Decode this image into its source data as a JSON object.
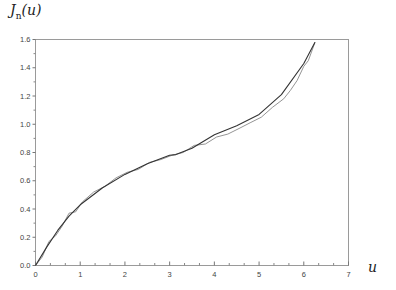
{
  "chart_data": {
    "type": "line",
    "title": "",
    "ylabel": "J_n(u)",
    "xlabel": "u",
    "xlim": [
      0,
      7
    ],
    "ylim": [
      0,
      1.6
    ],
    "xticks": [
      0,
      1,
      2,
      3,
      4,
      5,
      6,
      7
    ],
    "yticks": [
      0.0,
      0.2,
      0.4,
      0.6,
      0.8,
      1.0,
      1.2,
      1.4,
      1.6
    ],
    "xtick_labels": [
      "0",
      "1",
      "2",
      "3",
      "4",
      "5",
      "6",
      "7"
    ],
    "ytick_labels": [
      "0.0",
      "0.2",
      "0.4",
      "0.6",
      "0.8",
      "1.0",
      "1.2",
      "1.4",
      "1.6"
    ],
    "grid": false,
    "legend": null,
    "series": [
      {
        "name": "smooth",
        "color": "#333333",
        "x": [
          0,
          0.25,
          0.5,
          0.75,
          1.0,
          1.5,
          2.0,
          2.5,
          3.0,
          3.14,
          3.5,
          4.0,
          4.5,
          5.0,
          5.5,
          6.0,
          6.25
        ],
        "y": [
          0,
          0.13,
          0.25,
          0.35,
          0.43,
          0.55,
          0.645,
          0.72,
          0.78,
          0.785,
          0.83,
          0.925,
          0.99,
          1.07,
          1.21,
          1.43,
          1.58
        ]
      },
      {
        "name": "oscillating",
        "color": "#888888",
        "x": [
          0,
          0.15,
          0.3,
          0.45,
          0.6,
          0.75,
          0.9,
          1.05,
          1.3,
          1.55,
          1.8,
          2.05,
          2.3,
          2.55,
          2.8,
          3.05,
          3.3,
          3.55,
          3.8,
          4.05,
          4.3,
          4.55,
          4.8,
          5.05,
          5.3,
          5.55,
          5.7,
          5.85,
          6.0,
          6.1,
          6.25
        ],
        "y": [
          0,
          0.06,
          0.17,
          0.21,
          0.28,
          0.37,
          0.38,
          0.45,
          0.52,
          0.56,
          0.62,
          0.66,
          0.68,
          0.73,
          0.75,
          0.78,
          0.8,
          0.85,
          0.86,
          0.91,
          0.93,
          0.97,
          1.01,
          1.05,
          1.12,
          1.18,
          1.24,
          1.31,
          1.41,
          1.45,
          1.58
        ]
      }
    ]
  },
  "labels": {
    "ylabel_main": "J",
    "ylabel_sub": "n",
    "ylabel_arg": "(u)",
    "xlabel": "u"
  }
}
